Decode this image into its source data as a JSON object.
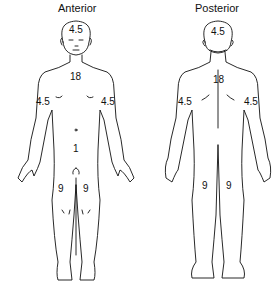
{
  "diagram": {
    "type": "rule-of-nines body surface area",
    "anterior": {
      "title": "Anterior",
      "labels": {
        "head": "4.5",
        "trunk": "18",
        "left_arm": "4.5",
        "right_arm": "4.5",
        "genitalia": "1",
        "left_leg": "9",
        "right_leg": "9"
      }
    },
    "posterior": {
      "title": "Posterior",
      "labels": {
        "head": "4.5",
        "trunk": "18",
        "left_arm": "4.5",
        "right_arm": "4.5",
        "left_leg": "9",
        "right_leg": "9"
      }
    },
    "colors": {
      "line": "#111111",
      "background": "#ffffff"
    }
  }
}
